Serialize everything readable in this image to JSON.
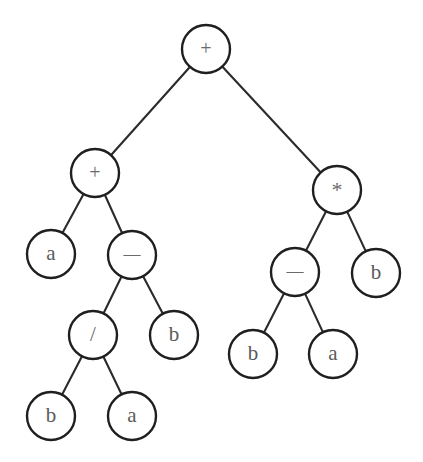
{
  "figure": {
    "name": "binary-expression-tree",
    "background_color": "#ffffff",
    "node_fill_color": "#ffffff",
    "node_stroke_color": "#1f1f1f",
    "edge_color": "#2b2b2b",
    "label_color": "#5a5a5a",
    "node_radius": 24,
    "canvas": {
      "width": 423,
      "height": 462
    }
  },
  "chart_data": {
    "type": "diagram",
    "subtype": "binary-tree",
    "expression": "(a + (b / a - b)) + ((b - a) * b)",
    "nodes": [
      {
        "id": "n0",
        "label": "+",
        "kind": "operator",
        "x": 206,
        "y": 49,
        "depth": 0
      },
      {
        "id": "n1",
        "label": "+",
        "kind": "operator",
        "x": 95,
        "y": 173,
        "depth": 1
      },
      {
        "id": "n2",
        "label": "*",
        "kind": "operator",
        "x": 337,
        "y": 190,
        "depth": 1
      },
      {
        "id": "n3",
        "label": "a",
        "kind": "operand",
        "x": 51,
        "y": 254,
        "depth": 2
      },
      {
        "id": "n4",
        "label": "—",
        "kind": "operator",
        "x": 132,
        "y": 255,
        "depth": 2
      },
      {
        "id": "n5",
        "label": "—",
        "kind": "operator",
        "x": 295,
        "y": 272,
        "depth": 2
      },
      {
        "id": "n6",
        "label": "b",
        "kind": "operand",
        "x": 376,
        "y": 273,
        "depth": 2
      },
      {
        "id": "n7",
        "label": "/",
        "kind": "operator",
        "x": 93,
        "y": 335,
        "depth": 3
      },
      {
        "id": "n8",
        "label": "b",
        "kind": "operand",
        "x": 174,
        "y": 335,
        "depth": 3
      },
      {
        "id": "n9",
        "label": "b",
        "kind": "operand",
        "x": 253,
        "y": 354,
        "depth": 3
      },
      {
        "id": "n10",
        "label": "a",
        "kind": "operand",
        "x": 333,
        "y": 354,
        "depth": 3
      },
      {
        "id": "n11",
        "label": "b",
        "kind": "operand",
        "x": 51,
        "y": 416,
        "depth": 4
      },
      {
        "id": "n12",
        "label": "a",
        "kind": "operand",
        "x": 132,
        "y": 416,
        "depth": 4
      }
    ],
    "edges": [
      {
        "from": "n0",
        "to": "n1",
        "side": "left"
      },
      {
        "from": "n0",
        "to": "n2",
        "side": "right"
      },
      {
        "from": "n1",
        "to": "n3",
        "side": "left"
      },
      {
        "from": "n1",
        "to": "n4",
        "side": "right"
      },
      {
        "from": "n2",
        "to": "n5",
        "side": "left"
      },
      {
        "from": "n2",
        "to": "n6",
        "side": "right"
      },
      {
        "from": "n4",
        "to": "n7",
        "side": "left"
      },
      {
        "from": "n4",
        "to": "n8",
        "side": "right"
      },
      {
        "from": "n5",
        "to": "n9",
        "side": "left"
      },
      {
        "from": "n5",
        "to": "n10",
        "side": "right"
      },
      {
        "from": "n7",
        "to": "n11",
        "side": "left"
      },
      {
        "from": "n7",
        "to": "n12",
        "side": "right"
      }
    ]
  }
}
